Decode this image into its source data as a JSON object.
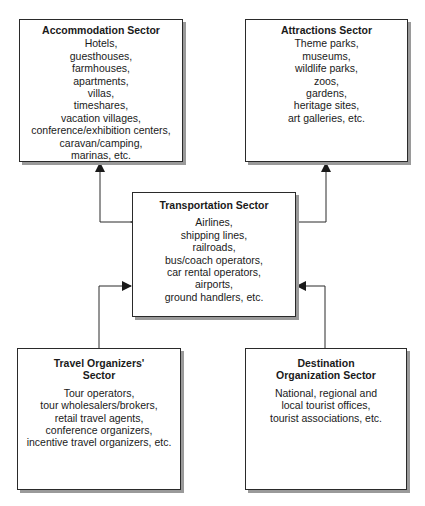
{
  "diagram": {
    "type": "sector-relationship-diagram",
    "nodes": [
      {
        "id": "accommodation",
        "title": "Accommodation Sector",
        "items": [
          "Hotels,",
          "guesthouses,",
          "farmhouses,",
          "apartments,",
          "villas,",
          "timeshares,",
          "vacation villages,",
          "conference/exhibition centers,",
          "caravan/camping,",
          "marinas, etc."
        ]
      },
      {
        "id": "attractions",
        "title": "Attractions Sector",
        "items": [
          "Theme parks,",
          "museums,",
          "wildlife parks,",
          "zoos,",
          "gardens,",
          "heritage sites,",
          "art galleries, etc."
        ]
      },
      {
        "id": "transportation",
        "title": "Transportation Sector",
        "items": [
          "Airlines,",
          "shipping lines,",
          "railroads,",
          "bus/coach operators,",
          "car rental operators,",
          "airports,",
          "ground handlers, etc."
        ]
      },
      {
        "id": "travel",
        "title_lines": [
          "Travel Organizers'",
          "Sector"
        ],
        "items": [
          "Tour operators,",
          "tour wholesalers/brokers,",
          "retail travel agents,",
          "conference organizers,",
          "incentive travel organizers, etc."
        ]
      },
      {
        "id": "destination",
        "title_lines": [
          "Destination",
          "Organization Sector"
        ],
        "items": [
          "National, regional and",
          "local tourist offices,",
          "tourist associations, etc."
        ]
      }
    ],
    "edges": [
      {
        "from": "transportation",
        "to": "accommodation",
        "arrow": "both"
      },
      {
        "from": "transportation",
        "to": "attractions",
        "arrow": "to"
      },
      {
        "from": "travel",
        "to": "transportation",
        "arrow": "to"
      },
      {
        "from": "destination",
        "to": "transportation",
        "arrow": "to"
      }
    ],
    "colors": {
      "line": "#2a2a2a",
      "shadow": "#9a9a9a",
      "background": "#ffffff"
    }
  }
}
